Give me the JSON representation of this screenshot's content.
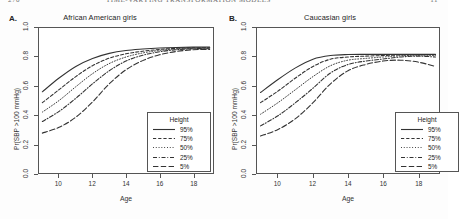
{
  "running_head": {
    "folio": "270",
    "title": "TIME-VARYING TRANSFORMATION MODELS",
    "page_number": "11"
  },
  "figure": {
    "panels": [
      {
        "letter": "A.",
        "title": "African American girls",
        "xlabel": "Age",
        "ylabel": "Pr(SBP >100 mmHg)",
        "legend_title": "Height"
      },
      {
        "letter": "B.",
        "title": "Caucasian girls",
        "xlabel": "Age",
        "ylabel": "Pr(SBP >100 mmHg)",
        "legend_title": "Height"
      }
    ]
  },
  "chart_data": [
    {
      "type": "line",
      "title": "African American girls",
      "panel_letter": "A.",
      "xlabel": "Age",
      "ylabel": "Pr(SBP >100 mmHg)",
      "xlim": [
        8.8,
        19.2
      ],
      "ylim": [
        0.0,
        1.0
      ],
      "xticks": [
        10,
        12,
        14,
        16,
        18
      ],
      "yticks": [
        0.0,
        0.2,
        0.4,
        0.6,
        0.8,
        1.0
      ],
      "grid": false,
      "legend_title": "Height",
      "legend_position": "bottom-right",
      "x": [
        9,
        10,
        11,
        12,
        13,
        14,
        15,
        16,
        17,
        18,
        19
      ],
      "series": [
        {
          "name": "95%",
          "dash": "solid",
          "values": [
            0.56,
            0.655,
            0.735,
            0.79,
            0.825,
            0.845,
            0.855,
            0.862,
            0.866,
            0.868,
            0.868
          ]
        },
        {
          "name": "75%",
          "dash": "dashed",
          "values": [
            0.485,
            0.575,
            0.665,
            0.74,
            0.792,
            0.822,
            0.84,
            0.852,
            0.86,
            0.864,
            0.864
          ]
        },
        {
          "name": "50%",
          "dash": "dotted",
          "values": [
            0.42,
            0.5,
            0.595,
            0.685,
            0.755,
            0.8,
            0.828,
            0.845,
            0.855,
            0.86,
            0.86
          ]
        },
        {
          "name": "25%",
          "dash": "dashdot",
          "values": [
            0.355,
            0.425,
            0.515,
            0.615,
            0.705,
            0.772,
            0.812,
            0.836,
            0.85,
            0.857,
            0.857
          ]
        },
        {
          "name": "5%",
          "dash": "longdash",
          "values": [
            0.275,
            0.315,
            0.385,
            0.49,
            0.615,
            0.712,
            0.775,
            0.815,
            0.838,
            0.85,
            0.852
          ]
        }
      ]
    },
    {
      "type": "line",
      "title": "Caucasian girls",
      "panel_letter": "B.",
      "xlabel": "Age",
      "ylabel": "Pr(SBP >100 mmHg)",
      "xlim": [
        8.8,
        19.2
      ],
      "ylim": [
        0.0,
        1.0
      ],
      "xticks": [
        10,
        12,
        14,
        16,
        18
      ],
      "yticks": [
        0.0,
        0.2,
        0.4,
        0.6,
        0.8,
        1.0
      ],
      "grid": false,
      "legend_title": "Height",
      "legend_position": "bottom-right",
      "x": [
        9,
        10,
        11,
        12,
        13,
        14,
        15,
        16,
        17,
        18,
        19
      ],
      "series": [
        {
          "name": "95%",
          "dash": "solid",
          "values": [
            0.555,
            0.645,
            0.725,
            0.785,
            0.81,
            0.817,
            0.818,
            0.818,
            0.818,
            0.818,
            0.818
          ]
        },
        {
          "name": "75%",
          "dash": "dashed",
          "values": [
            0.485,
            0.565,
            0.655,
            0.735,
            0.785,
            0.8,
            0.806,
            0.81,
            0.814,
            0.816,
            0.816
          ]
        },
        {
          "name": "50%",
          "dash": "dotted",
          "values": [
            0.405,
            0.485,
            0.575,
            0.665,
            0.74,
            0.778,
            0.79,
            0.8,
            0.808,
            0.812,
            0.812
          ]
        },
        {
          "name": "25%",
          "dash": "dashdot",
          "values": [
            0.325,
            0.395,
            0.485,
            0.585,
            0.69,
            0.748,
            0.772,
            0.786,
            0.8,
            0.806,
            0.8
          ]
        },
        {
          "name": "5%",
          "dash": "longdash",
          "values": [
            0.255,
            0.3,
            0.375,
            0.485,
            0.615,
            0.705,
            0.748,
            0.772,
            0.778,
            0.765,
            0.735
          ]
        }
      ]
    }
  ],
  "styles": {
    "line_color": "#333333",
    "frame_color": "#555555",
    "background": "#ffffff"
  }
}
